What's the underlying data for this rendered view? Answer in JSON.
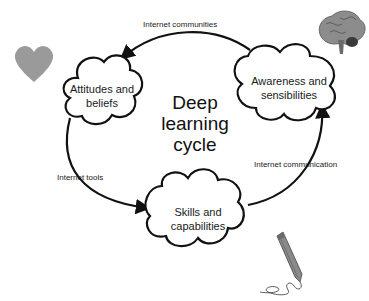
{
  "diagram": {
    "title": "Deep learning cycle",
    "title_lines": [
      "Deep",
      "learning",
      "cycle"
    ],
    "nodes": [
      {
        "id": "attitudes",
        "label_lines": [
          "Attitudes and",
          "beliefs"
        ]
      },
      {
        "id": "awareness",
        "label_lines": [
          "Awareness and",
          "sensibilities"
        ]
      },
      {
        "id": "skills",
        "label_lines": [
          "Skills and",
          "capabilities"
        ]
      }
    ],
    "edges": [
      {
        "from": "awareness",
        "to": "attitudes",
        "label": "Internet communities"
      },
      {
        "from": "attitudes",
        "to": "skills",
        "label": "Internet tools"
      },
      {
        "from": "skills",
        "to": "awareness",
        "label": "Internet communication"
      }
    ],
    "icons": {
      "heart": "heart-icon",
      "brain": "brain-icon",
      "pencil": "pencil-icon"
    },
    "colors": {
      "stroke": "#111111",
      "heart": "#9a9a9a",
      "pencil": "#8a8a8a",
      "background": "#ffffff"
    }
  }
}
